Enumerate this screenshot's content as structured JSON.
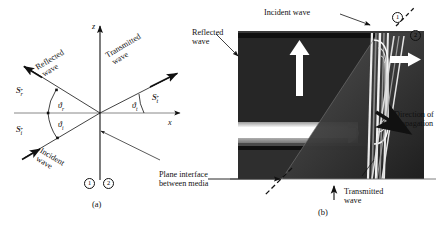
{
  "figure": {
    "panels": [
      {
        "id": "a",
        "caption": "(a)",
        "type": "schematic-ray-diagram",
        "axes": {
          "vertical_label": "z",
          "horizontal_label": "x"
        },
        "labels": {
          "reflected_wave": "Reflected\nwave",
          "reflected_wave_line1": "Reflected",
          "reflected_wave_line2": "wave",
          "transmitted_wave_line1": "Transmitted",
          "transmitted_wave_line2": "wave",
          "incident_wave_line1": "Incident",
          "incident_wave_line2": "wave",
          "interface_line1": "Plane interface",
          "interface_line2": "between media"
        },
        "vectors": [
          {
            "name": "reflected-poynting-vector",
            "symbol": "S",
            "subscript": "r",
            "accent": "arrow"
          },
          {
            "name": "incident-poynting-vector",
            "symbol": "S",
            "subscript": "i",
            "accent": "arrow"
          },
          {
            "name": "transmitted-poynting-vector",
            "symbol": "S",
            "subscript": "t",
            "accent": "arrow"
          }
        ],
        "angles": [
          {
            "name": "reflection-angle",
            "symbol": "ϑ",
            "subscript": "r"
          },
          {
            "name": "incidence-angle",
            "symbol": "ϑ",
            "subscript": "i"
          },
          {
            "name": "transmission-angle",
            "symbol": "ϑ",
            "subscript": "t"
          }
        ],
        "media": [
          {
            "name": "medium-one",
            "label": "1"
          },
          {
            "name": "medium-two",
            "label": "2"
          }
        ]
      },
      {
        "id": "b",
        "caption": "(b)",
        "type": "photograph",
        "labels": {
          "incident_wave": "Incident wave",
          "reflected_wave_line1": "Reflected",
          "reflected_wave_line2": "wave",
          "direction_line1": "Direction of",
          "direction_line2": "propagation",
          "transmitted_wave_line1": "Transmitted",
          "transmitted_wave_line2": "wave"
        },
        "media": [
          {
            "name": "medium-one",
            "label": "1"
          },
          {
            "name": "medium-two",
            "label": "2"
          }
        ]
      }
    ]
  },
  "colors": {
    "ink": "#111111",
    "axis": "#6f6f6f",
    "background": "#ffffff",
    "photo_dark": "#2b2b2b",
    "photo_mid": "#6a6a6a",
    "photo_light": "#e8e8e8"
  }
}
